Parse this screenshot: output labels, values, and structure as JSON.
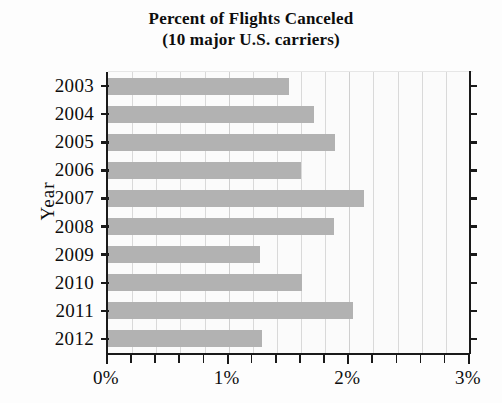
{
  "chart_data": {
    "type": "bar",
    "orientation": "horizontal",
    "title": "Percent of Flights Canceled (10 major U.S. carriers)",
    "title_line1": "Percent of Flights Canceled",
    "title_line2": "(10 major U.S. carriers)",
    "xlabel": "",
    "ylabel": "Year",
    "categories": [
      "2003",
      "2004",
      "2005",
      "2006",
      "2007",
      "2008",
      "2009",
      "2010",
      "2011",
      "2012"
    ],
    "values": [
      1.5,
      1.71,
      1.88,
      1.6,
      2.12,
      1.87,
      1.26,
      1.61,
      2.03,
      1.28
    ],
    "value_unit": "%",
    "xlim": [
      0,
      3
    ],
    "ylim_categories": 10,
    "x_tick_labels": [
      "0%",
      "1%",
      "2%",
      "3%"
    ],
    "x_tick_values": [
      0,
      1,
      2,
      3
    ],
    "x_minor_tick_step": 0.2,
    "grid": "vertical",
    "legend": "none",
    "bar_color": "#b2b2b2",
    "axis_color": "#1a1a1a",
    "grid_color": "#d9d9d9",
    "background_color": "#fbfbfb"
  }
}
